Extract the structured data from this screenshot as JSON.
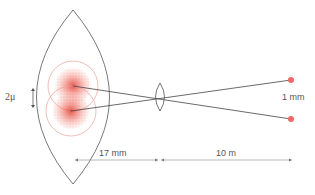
{
  "labels": {
    "retina_separation": "2μ",
    "source_separation": "1 mm",
    "eye_length": "17 mm",
    "object_distance": "10 m"
  },
  "colors": {
    "outline": "#555555",
    "blur": "#e8534a",
    "blur_ring": "#e9a19b",
    "dot": "#ee6a66",
    "dimension": "#777777"
  },
  "elements": {
    "eye": "lens-shaped eyeball outline",
    "pupil_lens": "small biconvex lens",
    "point_sources": 2,
    "blur_spots": 2
  }
}
